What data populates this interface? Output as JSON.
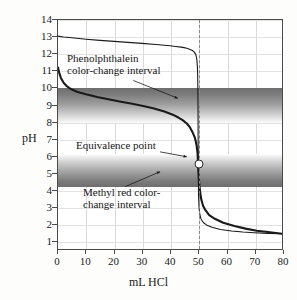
{
  "chart_data": {
    "type": "line",
    "title": "",
    "xlabel": "mL HCl",
    "ylabel": "pH",
    "xlim": [
      0,
      80
    ],
    "ylim": [
      0.5,
      14
    ],
    "grid": true,
    "legend": "none",
    "xticks": [
      0,
      10,
      20,
      30,
      40,
      50,
      60,
      70,
      80
    ],
    "xtick_labels": [
      "0",
      "10",
      "20",
      "30",
      "40",
      "50",
      "60",
      "70",
      "80"
    ],
    "yticks": [
      1,
      2,
      3,
      4,
      5,
      6,
      7,
      8,
      9,
      10,
      11,
      12,
      13,
      14
    ],
    "ytick_labels": [
      "1",
      "2",
      "3",
      "4",
      "5",
      "6",
      "7",
      "8",
      "9",
      "10",
      "11",
      "12",
      "13",
      "14"
    ],
    "series": [
      {
        "name": "strong base titrated with HCl",
        "style": "thin",
        "x": [
          0,
          2,
          5,
          10,
          15,
          20,
          25,
          30,
          35,
          40,
          42,
          44,
          45,
          46,
          47,
          48,
          48.6,
          49.1,
          49.4,
          49.6,
          49.8,
          49.9,
          50,
          50.1,
          50.2,
          50.4,
          50.6,
          51,
          51.5,
          52,
          53,
          55,
          58,
          62,
          66,
          70,
          75,
          80
        ],
        "y": [
          13.05,
          13.0,
          12.95,
          12.87,
          12.8,
          12.74,
          12.68,
          12.62,
          12.56,
          12.48,
          12.44,
          12.4,
          12.37,
          12.33,
          12.28,
          12.2,
          12.12,
          12.0,
          11.85,
          11.65,
          11.2,
          10.6,
          9.0,
          5.2,
          3.6,
          2.9,
          2.6,
          2.3,
          2.15,
          2.05,
          1.92,
          1.78,
          1.65,
          1.56,
          1.5,
          1.46,
          1.42,
          1.4
        ]
      },
      {
        "name": "weak base titrated with HCl",
        "style": "thick",
        "x": [
          0,
          0.5,
          1,
          2,
          3,
          4,
          5,
          7,
          10,
          14,
          18,
          22,
          26,
          30,
          34,
          38,
          41,
          43,
          44.5,
          46,
          47,
          48,
          48.8,
          49.2,
          49.5,
          49.7,
          49.85,
          49.95,
          50,
          50.05,
          50.15,
          50.3,
          50.5,
          50.8,
          51.2,
          51.8,
          52.6,
          54,
          56,
          59,
          63,
          67,
          71,
          75,
          80
        ],
        "y": [
          11.2,
          10.85,
          10.6,
          10.3,
          10.12,
          10.0,
          9.9,
          9.76,
          9.62,
          9.46,
          9.33,
          9.2,
          9.08,
          8.95,
          8.8,
          8.6,
          8.42,
          8.25,
          8.1,
          7.9,
          7.7,
          7.4,
          7.1,
          6.85,
          6.6,
          6.35,
          6.1,
          5.8,
          5.6,
          5.4,
          5.1,
          4.7,
          4.25,
          3.8,
          3.4,
          3.05,
          2.8,
          2.5,
          2.28,
          2.05,
          1.85,
          1.7,
          1.58,
          1.5,
          1.4
        ]
      }
    ],
    "bands": [
      {
        "name": "phenolphthalein-color-change-interval",
        "label_line1": "Phenolphthalein",
        "label_line2": "color-change interval",
        "ph_top": 10.0,
        "ph_bottom": 8.0,
        "gradient": "dark-top-to-light-bottom"
      },
      {
        "name": "methyl-red-color-change-interval",
        "label_line1": "Methyl red color-",
        "label_line2": "change interval",
        "ph_top": 6.2,
        "ph_bottom": 4.25,
        "gradient": "light-top-to-dark-bottom"
      }
    ],
    "markers": [
      {
        "name": "equivalence-point",
        "label": "Equivalence point",
        "x": 50,
        "y": 5.6,
        "style": "open-circle"
      }
    ],
    "reference_lines": [
      {
        "name": "equivalence-volume-line",
        "orientation": "vertical",
        "x": 50,
        "style": "dashed"
      }
    ]
  }
}
